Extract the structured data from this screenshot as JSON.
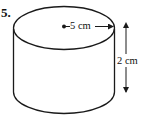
{
  "question": {
    "number": "5."
  },
  "figure": {
    "shape": "cylinder",
    "radius_label": "5 cm",
    "height_label": "2 cm",
    "stroke_color": "#1a1a1a",
    "background_color": "#ffffff"
  }
}
